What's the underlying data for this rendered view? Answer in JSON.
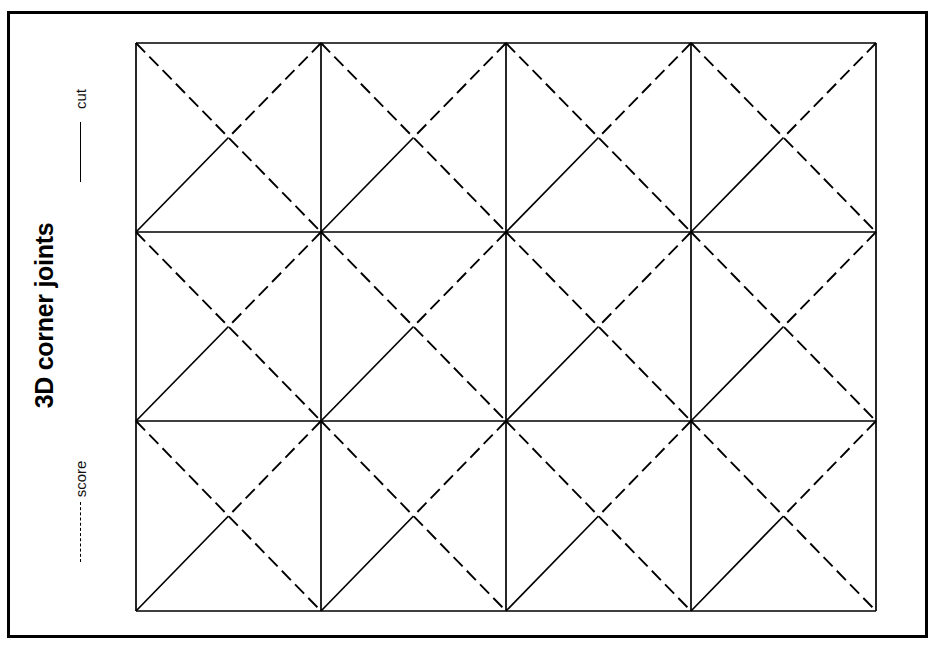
{
  "document": {
    "title": "3D corner joints",
    "background_color": "#ffffff",
    "ink_color": "#000000"
  },
  "frame": {
    "name": "outer-border",
    "x": 7,
    "y": 11,
    "width": 921,
    "height": 627,
    "stroke_width": 3
  },
  "legend": {
    "items": [
      {
        "label": "cut",
        "line_style": "solid",
        "meaning": "cut line",
        "x": 80,
        "y": 78
      },
      {
        "label": "score",
        "line_style": "dashed",
        "meaning": "score line",
        "x": 80,
        "y": 458
      }
    ]
  },
  "pattern": {
    "name": "corner-joint-tiling",
    "grid": {
      "left": 136,
      "top": 43,
      "right": 876,
      "bottom": 611,
      "columns": 4,
      "rows": 3,
      "column_edges": [
        136,
        321,
        506,
        691,
        876
      ],
      "row_edges": [
        43,
        232,
        421,
        611
      ],
      "cell_width": 185,
      "cell_height": 189
    },
    "line_styles": {
      "cut": {
        "style": "solid",
        "stroke_width": 1.7,
        "color": "#000000"
      },
      "score": {
        "style": "dashed",
        "stroke_width": 1.9,
        "color": "#000000",
        "dash": "13 6"
      }
    },
    "cell_motif": {
      "description": "Each rectangular cell is bordered by solid cut lines. A dashed score line runs the full anti-diagonal from the top-left corner to the bottom-right corner. A second dashed score line runs from the top-right corner down to the cell centre. A solid cut line runs from the bottom-left corner up to the cell centre.",
      "elements": [
        {
          "id": "cell-border",
          "type": "rect",
          "style": "cut"
        },
        {
          "id": "anti-diagonal-score",
          "type": "line",
          "from": "top-left",
          "to": "bottom-right",
          "style": "score"
        },
        {
          "id": "upper-right-score",
          "type": "line",
          "from": "top-right",
          "to": "center",
          "style": "score"
        },
        {
          "id": "lower-left-cut",
          "type": "line",
          "from": "bottom-left",
          "to": "center",
          "style": "cut"
        }
      ]
    }
  }
}
